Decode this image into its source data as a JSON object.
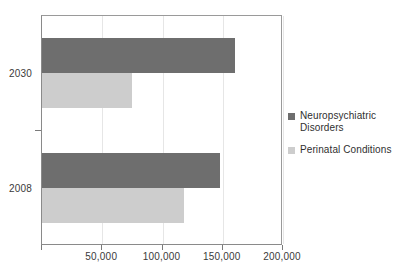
{
  "chart_data": {
    "type": "bar",
    "orientation": "horizontal",
    "title": "",
    "subtitle": "",
    "xlabel": "",
    "ylabel": "",
    "categories": [
      "2030",
      "2008"
    ],
    "series": [
      {
        "name": "Neuropsychiatric Disorders",
        "color": "#6e6e6e",
        "values": [
          160000,
          148000
        ]
      },
      {
        "name": "Perinatal Conditions",
        "color": "#cdcdcd",
        "values": [
          75000,
          118000
        ]
      }
    ],
    "xlim": [
      0,
      200000
    ],
    "x_ticks": [
      0,
      50000,
      100000,
      150000,
      200000
    ],
    "x_tick_labels": [
      "",
      "50,000",
      "100,000",
      "150,000",
      "200,000"
    ],
    "grid": true,
    "grid_axis": "x",
    "legend_position": "right"
  },
  "legend": {
    "entries": [
      {
        "label": "Neuropsychiatric Disorders",
        "swatch": "legend-swatch-dark"
      },
      {
        "label": "Perinatal Conditions",
        "swatch": "legend-swatch-light"
      }
    ]
  },
  "axes": {
    "y_tick_labels": [
      "2030",
      "2008"
    ],
    "x_tick_labels": [
      "",
      "50,000",
      "100,000",
      "150,000",
      "200,000"
    ]
  }
}
